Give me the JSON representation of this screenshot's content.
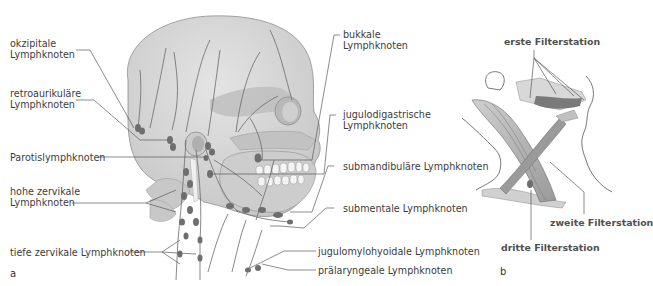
{
  "panel_a": {
    "letter": "a",
    "labels_left": {
      "okzipitale_1": "okzipitale",
      "okzipitale_2": "Lymphknoten",
      "retro_1": "retroaurikuläre",
      "retro_2": "Lymphknoten",
      "parotis": "Parotislymphknoten",
      "hohe_1": "hohe zervikale",
      "hohe_2": "Lymphknoten",
      "tiefe": "tiefe zervikale Lymphknoten"
    },
    "labels_right": {
      "bukkale_1": "bukkale",
      "bukkale_2": "Lymphknoten",
      "jugulodig_1": "jugulodigastrische",
      "jugulodig_2": "Lymphknoten",
      "submandibular": "submandibuläre Lymphknoten",
      "submental": "submentale Lymphknoten",
      "jugulomylo": "jugulomylohyoidale Lymphknoten",
      "pralaryng": "prälaryngeale Lymphknoten"
    }
  },
  "panel_b": {
    "letter": "b",
    "labels": {
      "erste": "erste Filterstation",
      "zweite": "zweite Filterstation",
      "dritte": "dritte Filterstation"
    }
  },
  "colors": {
    "skull_fill": "#d6d6d6",
    "skull_dark": "#b4b4b4",
    "node_fill": "#6e6e6e",
    "vessel": "#6a6a6a",
    "leader": "#5a5a5a",
    "muscle": "#8a8a8a",
    "text": "#3c3c3c"
  }
}
